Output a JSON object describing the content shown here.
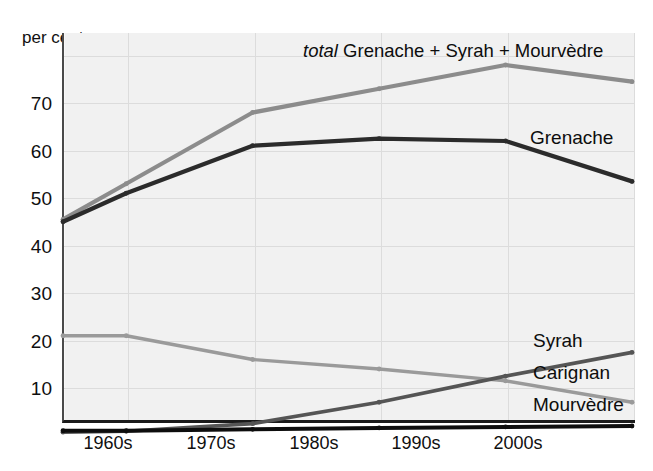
{
  "chart_data": {
    "type": "line",
    "title": "",
    "xlabel": "",
    "ylabel": "per cent",
    "ylim": [
      0,
      80
    ],
    "xlim": [
      1958,
      2008
    ],
    "grid": true,
    "legend_position": "inline-right",
    "yticks": [
      10,
      20,
      30,
      40,
      50,
      60,
      70
    ],
    "ytick_labels": [
      "10",
      "20",
      "30",
      "40",
      "50",
      "60",
      "70"
    ],
    "xtick_labels": [
      "1960s",
      "1970s",
      "1980s",
      "1990s",
      "2000s"
    ],
    "xticks": [
      1965,
      1975,
      1985,
      1995,
      2005
    ],
    "x": [
      1960,
      1965,
      1975,
      1985,
      1995,
      2005
    ],
    "series": [
      {
        "name": "total Grenache + Syrah + Mourvèdre",
        "label": "total Grenache + Syrah + Mourvèdre",
        "label_italic_prefix": "total",
        "label_rest": " Grenache + Syrah + Mourvèdre",
        "color": "#8c8c8c",
        "values": [
          45.5,
          53,
          68,
          73,
          78,
          74.5
        ]
      },
      {
        "name": "Grenache",
        "label": "Grenache",
        "color": "#2b2b2b",
        "values": [
          45,
          51,
          61,
          62.5,
          62,
          53.5
        ]
      },
      {
        "name": "Carignan",
        "label": "Carignan",
        "color": "#9a9a9a",
        "values": [
          21,
          21,
          16,
          14,
          11.5,
          7
        ]
      },
      {
        "name": "Syrah",
        "label": "Syrah",
        "color": "#555555",
        "values": [
          0.7,
          0.9,
          2.5,
          7,
          12.5,
          17.5
        ]
      },
      {
        "name": "Mourvèdre",
        "label": "Mourvèdre",
        "color": "#0d0d0d",
        "values": [
          1.0,
          1.0,
          1.3,
          1.6,
          1.8,
          2.0
        ]
      }
    ]
  },
  "axis": {
    "y_axis_title": "per cent",
    "y_ticks": [
      {
        "label": "70"
      },
      {
        "label": "60"
      },
      {
        "label": "50"
      },
      {
        "label": "40"
      },
      {
        "label": "30"
      },
      {
        "label": "20"
      },
      {
        "label": "10"
      }
    ],
    "x_ticks": [
      {
        "label": "1960s"
      },
      {
        "label": "1970s"
      },
      {
        "label": "1980s"
      },
      {
        "label": "1990s"
      },
      {
        "label": "2000s"
      }
    ]
  },
  "labels": {
    "total_italic": "total",
    "total_rest": " Grenache + Syrah + Mourvèdre",
    "grenache": "Grenache",
    "syrah": "Syrah",
    "carignan": "Carignan",
    "mourvedre": "Mourvèdre"
  },
  "colors": {
    "total": "#8c8c8c",
    "grenache": "#2b2b2b",
    "carignan": "#9a9a9a",
    "syrah": "#555555",
    "mourvedre": "#0d0d0d",
    "plot_background": "#f1f1f1",
    "grid": "#dcdcdc",
    "axis": "#1a1a1a"
  }
}
